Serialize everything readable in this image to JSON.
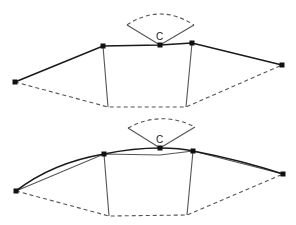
{
  "diagram": {
    "colors": {
      "stroke": "#1a1a1a",
      "thin": "#555555",
      "node": "#111111",
      "background": "#ffffff"
    },
    "top": {
      "label_c": "C",
      "nodes": [
        [
          15,
          82
        ],
        [
          103,
          46
        ],
        [
          160,
          45
        ],
        [
          192,
          43
        ],
        [
          282,
          65
        ]
      ],
      "bottom_points": [
        [
          108,
          107
        ],
        [
          186,
          107
        ]
      ],
      "fan": {
        "apex": [
          160,
          45
        ],
        "left": [
          127,
          25
        ],
        "right": [
          194,
          25
        ],
        "arc_peak_y": 14
      }
    },
    "bottom": {
      "label_c": "C",
      "nodes": [
        [
          16,
          191
        ],
        [
          104,
          154
        ],
        [
          160,
          148
        ],
        [
          193,
          151
        ],
        [
          283,
          174
        ]
      ],
      "bottom_points": [
        [
          109,
          216
        ],
        [
          187,
          215
        ]
      ],
      "fan": {
        "apex": [
          160,
          148
        ],
        "left": [
          128,
          128
        ],
        "right": [
          195,
          127
        ],
        "arc_peak_y": 120
      }
    }
  }
}
